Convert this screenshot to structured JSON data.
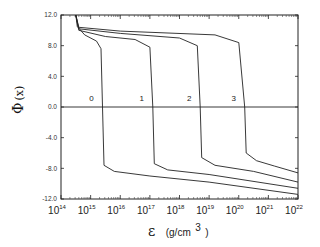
{
  "chart_data": {
    "type": "line",
    "title": "",
    "xlabel": "ε (g/cm³)",
    "xlabel_symbol": "ε",
    "xlabel_unit": "(g/cm",
    "xlabel_unit_exp": "3",
    "xlabel_unit_close": ")",
    "ylabel": "Φ (x)",
    "xscale": "log",
    "xlim": [
      100000000000000.0,
      1e+22
    ],
    "ylim": [
      -12.0,
      12.0
    ],
    "x_ticks": [
      {
        "base": "10",
        "exp": "14"
      },
      {
        "base": "10",
        "exp": "15"
      },
      {
        "base": "10",
        "exp": "16"
      },
      {
        "base": "10",
        "exp": "17"
      },
      {
        "base": "10",
        "exp": "18"
      },
      {
        "base": "10",
        "exp": "19"
      },
      {
        "base": "10",
        "exp": "20"
      },
      {
        "base": "10",
        "exp": "21"
      },
      {
        "base": "10",
        "exp": "22"
      }
    ],
    "y_ticks": [
      "12.0",
      "8.0",
      "4.0",
      "0.0",
      "-4.0",
      "-8.0",
      "-12.0"
    ],
    "grid": false,
    "legend": "none (curves labeled inline)",
    "reference_line": {
      "y": 0.0
    },
    "series": [
      {
        "name": "0",
        "label": "0",
        "points": [
          [
            14.5,
            12.0
          ],
          [
            14.55,
            10.5
          ],
          [
            14.8,
            9.4
          ],
          [
            15.2,
            8.6
          ],
          [
            15.35,
            7.6
          ],
          [
            15.4,
            0.0
          ],
          [
            15.45,
            -7.6
          ],
          [
            15.8,
            -8.4
          ],
          [
            17,
            -9.0
          ],
          [
            19,
            -9.8
          ],
          [
            22,
            -11.4
          ]
        ]
      },
      {
        "name": "1",
        "label": "1",
        "points": [
          [
            14.5,
            12.0
          ],
          [
            14.6,
            10.0
          ],
          [
            15.5,
            9.2
          ],
          [
            16.5,
            8.8
          ],
          [
            17.0,
            7.8
          ],
          [
            17.1,
            0.0
          ],
          [
            17.15,
            -7.4
          ],
          [
            17.6,
            -8.2
          ],
          [
            19,
            -8.8
          ],
          [
            22,
            -10.6
          ]
        ]
      },
      {
        "name": "2",
        "label": "2",
        "points": [
          [
            14.5,
            12.0
          ],
          [
            14.6,
            10.2
          ],
          [
            16,
            9.6
          ],
          [
            18.0,
            9.0
          ],
          [
            18.6,
            8.0
          ],
          [
            18.7,
            0.0
          ],
          [
            18.75,
            -6.6
          ],
          [
            19.2,
            -7.6
          ],
          [
            20.5,
            -8.4
          ],
          [
            22,
            -9.8
          ]
        ]
      },
      {
        "name": "3",
        "label": "3",
        "points": [
          [
            14.5,
            12.0
          ],
          [
            14.6,
            10.4
          ],
          [
            16,
            9.9
          ],
          [
            19.2,
            9.4
          ],
          [
            20.0,
            8.4
          ],
          [
            20.2,
            0.0
          ],
          [
            20.25,
            -6.0
          ],
          [
            20.6,
            -7.0
          ],
          [
            21.2,
            -7.7
          ],
          [
            22,
            -8.6
          ]
        ]
      }
    ]
  }
}
